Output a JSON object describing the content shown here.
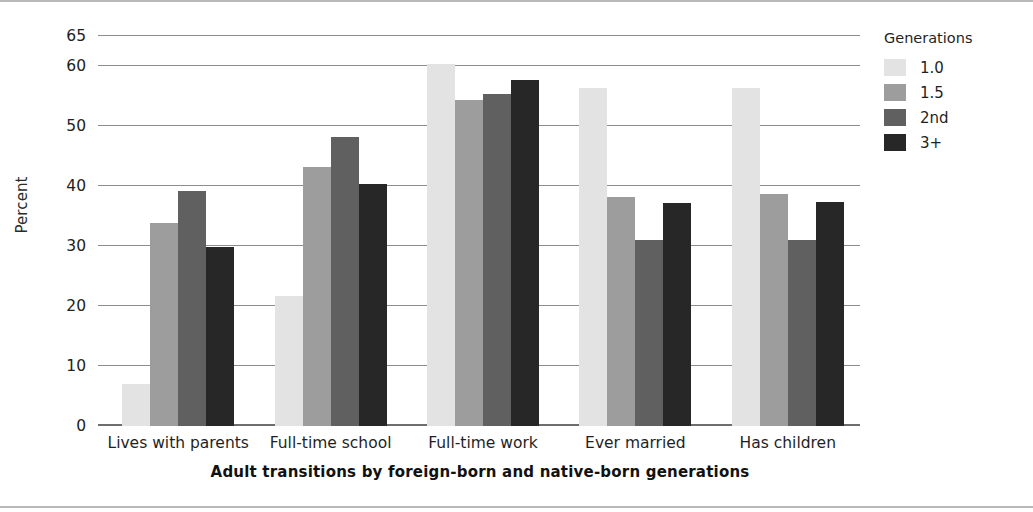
{
  "chart_data": {
    "type": "bar",
    "title": "",
    "xlabel": "Adult transitions by foreign-born and native-born generations",
    "ylabel": "Percent",
    "categories": [
      "Lives with parents",
      "Full-time school",
      "Full-time work",
      "Ever married",
      "Has children"
    ],
    "series": [
      {
        "name": "1.0",
        "color": "#e3e3e3",
        "values": [
          7,
          21.7,
          60.3,
          56.3,
          56.3
        ]
      },
      {
        "name": "1.5",
        "color": "#9d9d9d",
        "values": [
          33.8,
          43.2,
          54.3,
          38.1,
          38.6
        ]
      },
      {
        "name": "2nd",
        "color": "#606060",
        "values": [
          39.1,
          48.2,
          55.4,
          31.0,
          31.0
        ]
      },
      {
        "name": "3+",
        "color": "#272727",
        "values": [
          29.8,
          40.3,
          57.6,
          37.1,
          37.3
        ]
      }
    ],
    "ylim": [
      0,
      65
    ],
    "yticks": [
      0,
      10,
      20,
      30,
      40,
      50,
      60,
      65
    ],
    "ytick_labels": [
      "0",
      "10",
      "20",
      "30",
      "40",
      "50",
      "60",
      "65"
    ],
    "grid": true,
    "legend": {
      "title": "Generations",
      "position": "right",
      "entries": [
        "1.0",
        "1.5",
        "2nd",
        "3+"
      ]
    }
  },
  "legend": {
    "title": "Generations",
    "items": [
      {
        "label": "1.0",
        "swatch": "legend-swatch-1-0"
      },
      {
        "label": "1.5",
        "swatch": "legend-swatch-1-5"
      },
      {
        "label": "2nd",
        "swatch": "legend-swatch-2nd"
      },
      {
        "label": "3+",
        "swatch": "legend-swatch-3plus"
      }
    ]
  },
  "axes": {
    "y_title": "Percent",
    "x_title": "Adult transitions by foreign-born and native-born generations"
  }
}
